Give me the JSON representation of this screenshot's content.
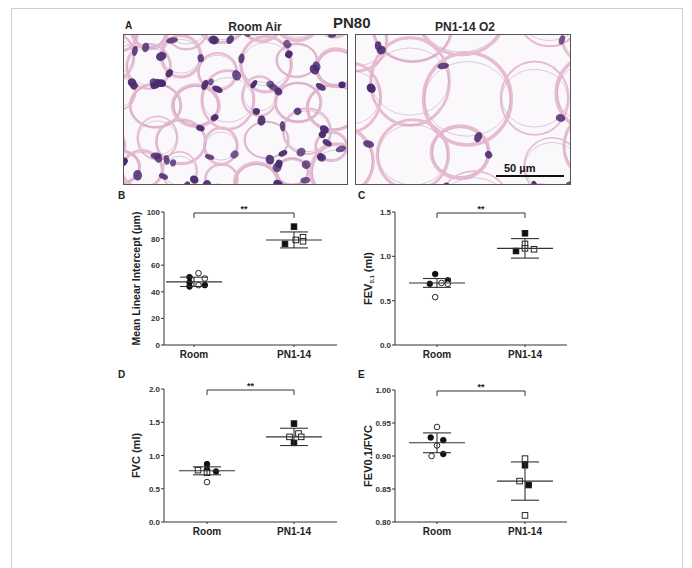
{
  "figure": {
    "title": "PN80",
    "panel_a": {
      "letter": "A",
      "left_title": "Room Air",
      "right_title": "PN1-14 O2",
      "scale_bar_label": "50 µm"
    }
  },
  "colors": {
    "axis": "#333333",
    "text": "#222222",
    "nuclei": "#4a2a6e",
    "tissue": "#e7bcd2",
    "frame": "#cfcfcf"
  },
  "chart_data": [
    {
      "panel": "B",
      "type": "scatter",
      "title": "",
      "xlabel": "",
      "ylabel": "Mean Linear Intercept (µm)",
      "categories": [
        "Room",
        "PN1-14"
      ],
      "ylim": [
        0,
        100
      ],
      "yticks": [
        "0",
        "20",
        "40",
        "60",
        "80",
        "100"
      ],
      "ytick_values": [
        0,
        20,
        40,
        60,
        80,
        100
      ],
      "significance": "**",
      "series": [
        {
          "name": "Room",
          "mean": 47.5,
          "sd": 3.5,
          "points": [
            {
              "dx": -0.05,
              "y": 51,
              "filled": true,
              "shape": "circle"
            },
            {
              "dx": -0.05,
              "y": 47,
              "filled": true,
              "shape": "circle"
            },
            {
              "dx": -0.05,
              "y": 44,
              "filled": true,
              "shape": "circle"
            },
            {
              "dx": 0.05,
              "y": 54,
              "filled": false,
              "shape": "circle"
            },
            {
              "dx": 0.05,
              "y": 45,
              "filled": false,
              "shape": "circle"
            },
            {
              "dx": 0.12,
              "y": 50,
              "filled": false,
              "shape": "circle"
            },
            {
              "dx": 0.12,
              "y": 45,
              "filled": true,
              "shape": "circle"
            }
          ]
        },
        {
          "name": "PN1-14",
          "mean": 79,
          "sd": 6,
          "points": [
            {
              "dx": 0.0,
              "y": 89,
              "filled": true,
              "shape": "square"
            },
            {
              "dx": -0.1,
              "y": 76,
              "filled": true,
              "shape": "square"
            },
            {
              "dx": 0.02,
              "y": 79,
              "filled": false,
              "shape": "square"
            },
            {
              "dx": 0.1,
              "y": 81,
              "filled": false,
              "shape": "square"
            },
            {
              "dx": 0.1,
              "y": 78,
              "filled": false,
              "shape": "square"
            }
          ]
        }
      ]
    },
    {
      "panel": "C",
      "type": "scatter",
      "title": "",
      "xlabel": "",
      "ylabel": "FEV0.1 (ml)",
      "ylabel_main": "FEV",
      "ylabel_sub": "0.1",
      "ylabel_suffix": " (ml)",
      "categories": [
        "Room",
        "PN1-14"
      ],
      "ylim": [
        0,
        1.5
      ],
      "yticks": [
        "0.0",
        "0.5",
        "1.0",
        "1.5"
      ],
      "ytick_values": [
        0,
        0.5,
        1.0,
        1.5
      ],
      "significance": "**",
      "series": [
        {
          "name": "Room",
          "mean": 0.7,
          "sd": 0.05,
          "points": [
            {
              "dx": -0.08,
              "y": 0.69,
              "filled": true,
              "shape": "circle"
            },
            {
              "dx": -0.02,
              "y": 0.8,
              "filled": true,
              "shape": "circle"
            },
            {
              "dx": 0.05,
              "y": 0.7,
              "filled": false,
              "shape": "circle"
            },
            {
              "dx": 0.12,
              "y": 0.73,
              "filled": true,
              "shape": "circle"
            },
            {
              "dx": 0.12,
              "y": 0.69,
              "filled": false,
              "shape": "circle"
            },
            {
              "dx": -0.02,
              "y": 0.54,
              "filled": false,
              "shape": "circle"
            }
          ]
        },
        {
          "name": "PN1-14",
          "mean": 1.09,
          "sd": 0.11,
          "points": [
            {
              "dx": 0.0,
              "y": 1.26,
              "filled": true,
              "shape": "square"
            },
            {
              "dx": -0.1,
              "y": 1.06,
              "filled": true,
              "shape": "square"
            },
            {
              "dx": 0.0,
              "y": 1.14,
              "filled": false,
              "shape": "square"
            },
            {
              "dx": 0.0,
              "y": 1.09,
              "filled": false,
              "shape": "square"
            },
            {
              "dx": 0.1,
              "y": 1.08,
              "filled": false,
              "shape": "square"
            }
          ]
        }
      ]
    },
    {
      "panel": "D",
      "type": "scatter",
      "title": "",
      "xlabel": "",
      "ylabel": "FVC (ml)",
      "categories": [
        "Room",
        "PN1-14"
      ],
      "ylim": [
        0,
        2.0
      ],
      "yticks": [
        "0.0",
        "0.5",
        "1.0",
        "1.5",
        "2.0"
      ],
      "ytick_values": [
        0,
        0.5,
        1.0,
        1.5,
        2.0
      ],
      "significance": "**",
      "series": [
        {
          "name": "Room",
          "mean": 0.77,
          "sd": 0.06,
          "points": [
            {
              "dx": -0.1,
              "y": 0.78,
              "filled": false,
              "shape": "square"
            },
            {
              "dx": 0.0,
              "y": 0.87,
              "filled": true,
              "shape": "circle"
            },
            {
              "dx": 0.0,
              "y": 0.79,
              "filled": true,
              "shape": "circle"
            },
            {
              "dx": 0.0,
              "y": 0.74,
              "filled": false,
              "shape": "square"
            },
            {
              "dx": 0.1,
              "y": 0.76,
              "filled": true,
              "shape": "circle"
            },
            {
              "dx": 0.0,
              "y": 0.6,
              "filled": false,
              "shape": "circle"
            }
          ]
        },
        {
          "name": "PN1-14",
          "mean": 1.28,
          "sd": 0.13,
          "points": [
            {
              "dx": 0.0,
              "y": 1.48,
              "filled": true,
              "shape": "square"
            },
            {
              "dx": -0.05,
              "y": 1.28,
              "filled": false,
              "shape": "square"
            },
            {
              "dx": 0.05,
              "y": 1.33,
              "filled": false,
              "shape": "square"
            },
            {
              "dx": 0.08,
              "y": 1.28,
              "filled": false,
              "shape": "square"
            },
            {
              "dx": 0.0,
              "y": 1.19,
              "filled": true,
              "shape": "square"
            }
          ]
        }
      ]
    },
    {
      "panel": "E",
      "type": "scatter",
      "title": "",
      "xlabel": "",
      "ylabel": "FEV0.1/FVC",
      "categories": [
        "Room",
        "PN1-14"
      ],
      "ylim": [
        0.8,
        1.0
      ],
      "yticks": [
        "0.80",
        "0.85",
        "0.90",
        "0.95",
        "1.00"
      ],
      "ytick_values": [
        0.8,
        0.85,
        0.9,
        0.95,
        1.0
      ],
      "significance": "**",
      "series": [
        {
          "name": "Room",
          "mean": 0.92,
          "sd": 0.015,
          "points": [
            {
              "dx": 0.0,
              "y": 0.944,
              "filled": false,
              "shape": "circle"
            },
            {
              "dx": -0.07,
              "y": 0.928,
              "filled": true,
              "shape": "circle"
            },
            {
              "dx": 0.07,
              "y": 0.924,
              "filled": true,
              "shape": "circle"
            },
            {
              "dx": 0.0,
              "y": 0.916,
              "filled": false,
              "shape": "circle"
            },
            {
              "dx": -0.06,
              "y": 0.9,
              "filled": false,
              "shape": "circle"
            },
            {
              "dx": 0.07,
              "y": 0.903,
              "filled": true,
              "shape": "circle"
            }
          ]
        },
        {
          "name": "PN1-14",
          "mean": 0.862,
          "sd": 0.029,
          "points": [
            {
              "dx": 0.0,
              "y": 0.896,
              "filled": false,
              "shape": "square"
            },
            {
              "dx": 0.0,
              "y": 0.886,
              "filled": true,
              "shape": "square"
            },
            {
              "dx": -0.06,
              "y": 0.862,
              "filled": false,
              "shape": "square"
            },
            {
              "dx": 0.04,
              "y": 0.856,
              "filled": true,
              "shape": "square"
            },
            {
              "dx": 0.0,
              "y": 0.81,
              "filled": false,
              "shape": "square"
            }
          ]
        }
      ]
    }
  ]
}
